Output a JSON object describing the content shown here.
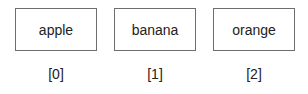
{
  "array": {
    "items": [
      {
        "value": "apple",
        "index": "[0]"
      },
      {
        "value": "banana",
        "index": "[1]"
      },
      {
        "value": "orange",
        "index": "[2]"
      }
    ]
  }
}
